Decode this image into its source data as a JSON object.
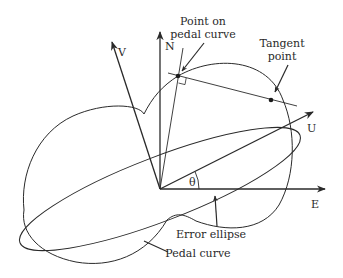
{
  "diagram": {
    "type": "geometry",
    "axes": {
      "north": "N",
      "east": "E",
      "u": "U",
      "v": "V",
      "angle": "θ"
    },
    "annotations": {
      "point_on_pedal_line1": "Point on",
      "point_on_pedal_line2": "pedal curve",
      "tangent_line1": "Tangent",
      "tangent_line2": "point",
      "error_ellipse": "Error ellipse",
      "pedal_curve": "Pedal curve"
    },
    "colors": {
      "stroke": "#2a2a2a",
      "background": "#ffffff"
    }
  }
}
